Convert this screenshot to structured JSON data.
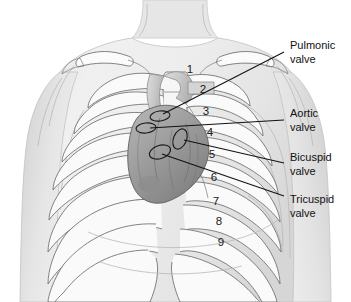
{
  "figure": {
    "background_color": "#ffffff",
    "line_color": "#111111",
    "skin_fill": "#e9e9e9",
    "bone_fill": "#f7f7f7",
    "heart_fill": "#9a9a9a",
    "heart_dark": "#7d7d7d"
  },
  "labels": [
    {
      "id": "pulmonic",
      "line1": "Pulmonic",
      "line2": "valve",
      "text_x": 290,
      "text_y": 46,
      "leader": "M284,52 L163,114"
    },
    {
      "id": "aortic",
      "line1": "Aortic",
      "line2": "valve",
      "text_x": 290,
      "text_y": 114,
      "leader": "M284,120 L150,128"
    },
    {
      "id": "bicuspid",
      "line1": "Bicuspid",
      "line2": "valve",
      "text_x": 290,
      "text_y": 158,
      "leader": "M284,163 L184,140"
    },
    {
      "id": "tricuspid",
      "line1": "Tricuspid",
      "line2": "valve",
      "text_x": 290,
      "text_y": 200,
      "leader": "M284,196 L162,154"
    }
  ],
  "rib_numbers": [
    {
      "n": "1",
      "x": 190,
      "y": 70
    },
    {
      "n": "2",
      "x": 203,
      "y": 90
    },
    {
      "n": "3",
      "x": 206,
      "y": 112
    },
    {
      "n": "4",
      "x": 210,
      "y": 133
    },
    {
      "n": "5",
      "x": 212,
      "y": 155
    },
    {
      "n": "6",
      "x": 214,
      "y": 178
    },
    {
      "n": "7",
      "x": 216,
      "y": 202
    },
    {
      "n": "8",
      "x": 219,
      "y": 222
    },
    {
      "n": "9",
      "x": 221,
      "y": 243
    }
  ],
  "valve_markers": [
    {
      "id": "pulmonic-site",
      "cx": 160,
      "cy": 116,
      "rx": 10,
      "ry": 5.0,
      "rot": -8
    },
    {
      "id": "aortic-site",
      "cx": 146,
      "cy": 128,
      "rx": 10,
      "ry": 5.0,
      "rot": -6
    },
    {
      "id": "bicuspid-site",
      "cx": 180,
      "cy": 139,
      "rx": 6.5,
      "ry": 10.5,
      "rot": 22
    },
    {
      "id": "tricuspid-site",
      "cx": 160,
      "cy": 152,
      "rx": 11,
      "ry": 6.5,
      "rot": -18
    }
  ]
}
